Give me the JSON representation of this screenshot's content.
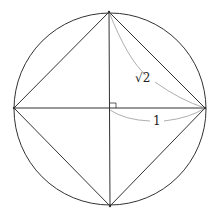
{
  "diagram": {
    "labels": {
      "diagonal_side": "√2",
      "radius": "1"
    },
    "colors": {
      "stroke": "#333333",
      "brace": "#999999",
      "background": "#ffffff"
    }
  }
}
